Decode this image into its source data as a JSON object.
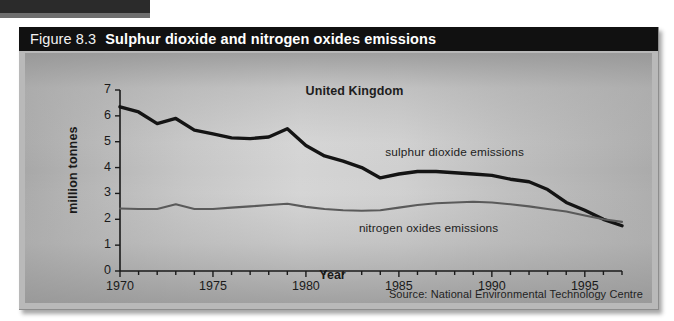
{
  "figure": {
    "number_label": "Figure 8.3",
    "title": "Sulphur dioxide and nitrogen oxides emissions",
    "region_label": "United Kingdom",
    "source": "Source: National Environmental Technology Centre"
  },
  "chart_data": {
    "type": "line",
    "title": "Sulphur dioxide and nitrogen oxides emissions",
    "subtitle": "United Kingdom",
    "xlabel": "Year",
    "ylabel": "million tonnes",
    "xlim": [
      1970,
      1997
    ],
    "ylim": [
      0,
      7
    ],
    "ytick_labels": [
      "0",
      "1",
      "2",
      "3",
      "4",
      "5",
      "6",
      "7"
    ],
    "ytick_values": [
      0,
      1,
      2,
      3,
      4,
      5,
      6,
      7
    ],
    "xtick_labels": [
      "1970",
      "1975",
      "1980",
      "1985",
      "1990",
      "1995"
    ],
    "xtick_values": [
      1970,
      1975,
      1980,
      1985,
      1990,
      1995
    ],
    "minor_xticks_every": 1,
    "grid": false,
    "legend_position": "inline-annotation",
    "x": [
      1970,
      1971,
      1972,
      1973,
      1974,
      1975,
      1976,
      1977,
      1978,
      1979,
      1980,
      1981,
      1982,
      1983,
      1984,
      1985,
      1986,
      1987,
      1988,
      1989,
      1990,
      1991,
      1992,
      1993,
      1994,
      1995,
      1996,
      1997
    ],
    "series": [
      {
        "name": "sulphur dioxide emissions",
        "color": "#141414",
        "width": 3.4,
        "values": [
          6.35,
          6.15,
          5.7,
          5.9,
          5.45,
          5.3,
          5.15,
          5.12,
          5.18,
          5.5,
          4.85,
          4.45,
          4.25,
          4.0,
          3.6,
          3.75,
          3.85,
          3.85,
          3.8,
          3.75,
          3.7,
          3.55,
          3.45,
          3.15,
          2.65,
          2.35,
          2.0,
          1.75
        ]
      },
      {
        "name": "nitrogen oxides emissions",
        "color": "#5a5a5a",
        "width": 2.1,
        "values": [
          2.42,
          2.4,
          2.4,
          2.58,
          2.4,
          2.4,
          2.45,
          2.5,
          2.55,
          2.6,
          2.48,
          2.4,
          2.35,
          2.33,
          2.35,
          2.45,
          2.55,
          2.62,
          2.65,
          2.68,
          2.65,
          2.58,
          2.5,
          2.4,
          2.3,
          2.15,
          2.0,
          1.9
        ]
      }
    ],
    "annotations": [
      {
        "text": "sulphur dioxide emissions",
        "x": 1988.0,
        "y": 4.55
      },
      {
        "text": "nitrogen oxides emissions",
        "x": 1986.6,
        "y": 1.62
      }
    ]
  }
}
